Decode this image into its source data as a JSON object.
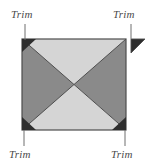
{
  "figure": {
    "canvas": {
      "width": 149,
      "height": 165,
      "background": "#ffffff"
    },
    "square": {
      "left": 22,
      "top": 39,
      "right": 126,
      "bottom": 130,
      "outline_color": "#4d4d4d"
    },
    "colors": {
      "light_fill": "#d5d5d5",
      "dark_fill": "#8a8a8a",
      "trim_fill": "#2e2e2e",
      "outline": "#4d4d4d",
      "leader_line": "#6e6e6e",
      "text": "#4a4a4a"
    },
    "quadrants": [
      {
        "name": "top-triangle",
        "fill": "#d5d5d5"
      },
      {
        "name": "right-triangle",
        "fill": "#8a8a8a"
      },
      {
        "name": "bottom-triangle",
        "fill": "#d5d5d5"
      },
      {
        "name": "left-triangle",
        "fill": "#8a8a8a"
      }
    ],
    "trim_triangles": [
      {
        "name": "trim-corner-top-left",
        "position": "top-left",
        "detached": false
      },
      {
        "name": "trim-corner-top-right",
        "position": "top-right",
        "detached": true
      },
      {
        "name": "trim-corner-bottom-left",
        "position": "bottom-left",
        "detached": false
      },
      {
        "name": "trim-corner-bottom-right",
        "position": "bottom-right",
        "detached": false
      }
    ],
    "labels": {
      "top_left": "Trim",
      "top_right": "Trim",
      "bottom_left": "Trim",
      "bottom_right": "Trim"
    }
  }
}
